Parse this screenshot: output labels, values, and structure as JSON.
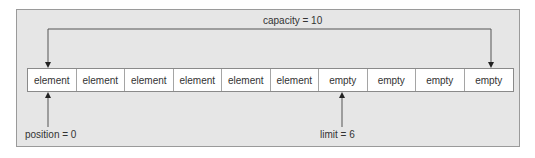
{
  "diagram": {
    "capacity_label": "capacity = 10",
    "position_label": "position = 0",
    "limit_label": "limit = 6",
    "cells": [
      {
        "label": "element"
      },
      {
        "label": "element"
      },
      {
        "label": "element"
      },
      {
        "label": "element"
      },
      {
        "label": "element"
      },
      {
        "label": "element"
      },
      {
        "label": "empty"
      },
      {
        "label": "empty"
      },
      {
        "label": "empty"
      },
      {
        "label": "empty"
      }
    ],
    "colors": {
      "panel_bg": "#e6e6e6",
      "cell_bg": "#ffffff",
      "line": "#555555"
    }
  }
}
